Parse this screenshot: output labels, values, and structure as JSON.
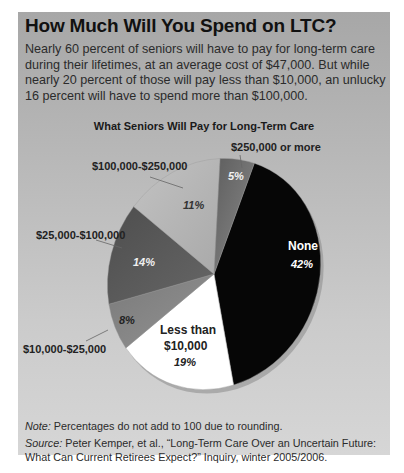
{
  "header": {
    "title": "How Much Will You Spend on LTC?",
    "intro": "Nearly 60 percent of seniors will have to pay for long-term care during their lifetimes, at an average cost of $47,000. But while nearly 20 percent of those will pay less than $10,000, an unlucky 16 percent will have to spend more than $100,000."
  },
  "footer": {
    "note_label": "Note:",
    "note_text": " Percentages do not add to 100 due to rounding.",
    "source_label": "Source:",
    "source_text": " Peter Kemper, et al., “Long-Term Care Over an Uncertain Future: What Can Current Retirees Expect?” Inquiry, winter 2005/2006."
  },
  "chart_data": {
    "type": "pie",
    "title": "What Seniors Will Pay for Long-Term Care",
    "categories": [
      "None",
      "Less than $10,000",
      "$10,000-$25,000",
      "$25,000-$100,000",
      "$100,000-$250,000",
      "$250,000 or more"
    ],
    "values": [
      42,
      19,
      8,
      14,
      11,
      5
    ],
    "unit": "%",
    "labels": [
      "42%",
      "19%",
      "8%",
      "14%",
      "11%",
      "5%"
    ],
    "annotation": "Percentages do not add to 100 due to rounding.",
    "legend": "none (direct labels with leader lines)",
    "colors": [
      "#060606",
      "#ffffff",
      "#858585",
      "#585858",
      "#b8b8b8",
      "#6e6e6e"
    ]
  },
  "pie": {
    "inner_labels": {
      "none_name": "None",
      "none_pct": "42%",
      "less_line1": "Less than",
      "less_line2": "$10,000",
      "less_pct": "19%",
      "p8": "8%",
      "p14": "14%",
      "p11": "11%",
      "p5": "5%"
    },
    "outer_labels": {
      "l10_25": "$10,000-$25,000",
      "l25_100": "$25,000-$100,000",
      "l100_250": "$100,000-$250,000",
      "l250": "$250,000 or more"
    }
  }
}
